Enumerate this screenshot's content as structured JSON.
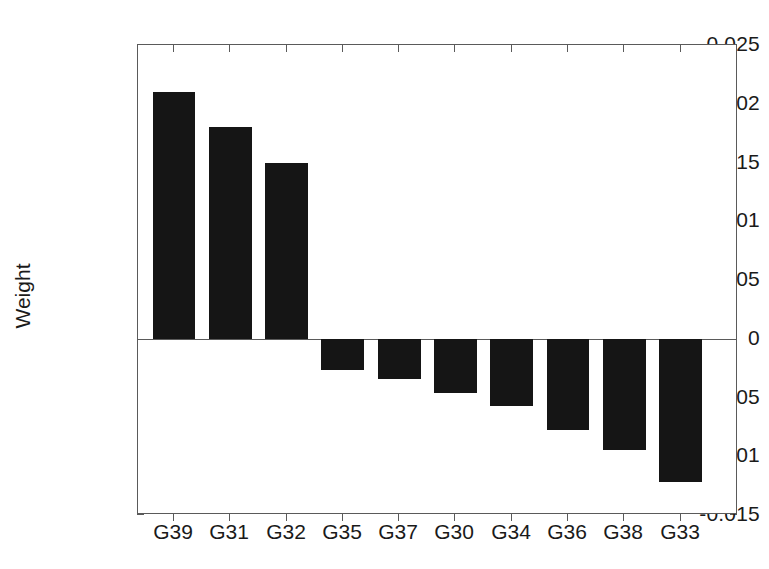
{
  "chart_data": {
    "type": "bar",
    "title": "",
    "subtitle": "",
    "xlabel": "",
    "ylabel": "Weight",
    "categories": [
      "G39",
      "G31",
      "G32",
      "G35",
      "G37",
      "G30",
      "G34",
      "G36",
      "G38",
      "G33"
    ],
    "values": [
      0.021,
      0.018,
      0.015,
      -0.0027,
      -0.0034,
      -0.0046,
      -0.0057,
      -0.0078,
      -0.0095,
      -0.0122
    ],
    "ylim": [
      -0.015,
      0.025
    ],
    "ytick_labels": [
      "0.025",
      "0.02",
      "0.015",
      "0.01",
      "0.005",
      "0",
      "-0.005",
      "-0.01",
      "-0.015"
    ],
    "ytick_values": [
      0.025,
      0.02,
      0.015,
      0.01,
      0.005,
      0,
      -0.005,
      -0.01,
      -0.015
    ],
    "grid": false,
    "legend": null,
    "bar_color": "#151515",
    "axis_color": "#5a5a5a",
    "annotations": []
  },
  "figure": {
    "background_color": "#ffffff",
    "text_color": "#1a1a1a"
  }
}
